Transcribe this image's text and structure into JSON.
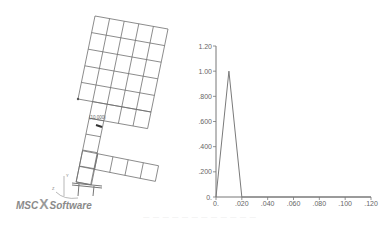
{
  "mesh": {
    "node_label": "(10,000)",
    "axis_labels": {
      "y": "Y",
      "z": "Z",
      "x": "X"
    },
    "logo": {
      "prefix": "MSC",
      "separator": "X",
      "suffix": "Software"
    },
    "line_color": "#6e6e6e"
  },
  "caption": {
    "text": "—  —  —    — — — — — — — — —"
  },
  "chart_data": {
    "type": "line",
    "title": "",
    "xlabel": "",
    "ylabel": "",
    "x": [
      0.0,
      0.01,
      0.02,
      0.12
    ],
    "series": [
      {
        "name": "load",
        "values": [
          0.0,
          1.0,
          0.0,
          0.0
        ],
        "color": "#7a7a7a"
      }
    ],
    "xlim": [
      0,
      0.12
    ],
    "ylim": [
      0,
      1.2
    ],
    "x_ticks": [
      "0.",
      ".020",
      ".040",
      ".060",
      ".080",
      ".100",
      ".120"
    ],
    "y_ticks": [
      "0.",
      ".200",
      ".400",
      ".600",
      ".800",
      "1.00",
      "1.20"
    ],
    "grid": false,
    "legend": null
  }
}
